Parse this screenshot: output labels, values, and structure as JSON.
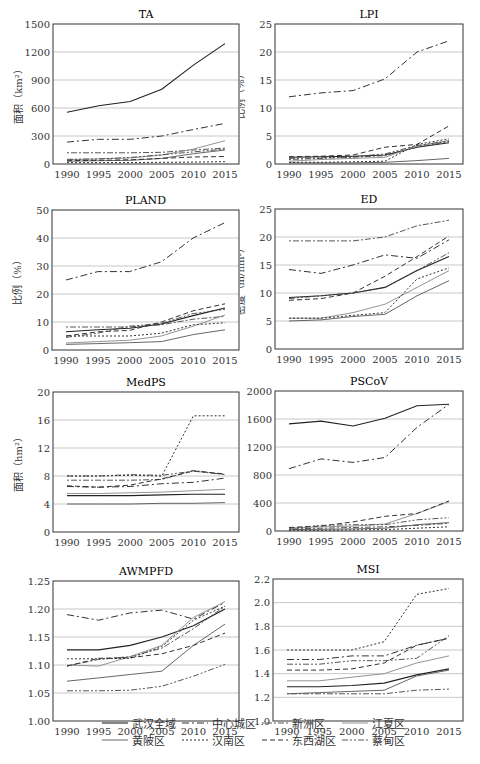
{
  "years": [
    1990,
    1995,
    2000,
    2005,
    2010,
    2015
  ],
  "series_names": [
    "武汉全域",
    "中心城区",
    "新洲区",
    "江夏区",
    "黄陂区",
    "汉南区",
    "东西湖区",
    "蔡甸区"
  ],
  "series_styles": [
    {
      "dash": "",
      "color": "#222",
      "width": 1.1
    },
    {
      "dash": "7,3,2,3",
      "color": "#333",
      "width": 1.0
    },
    {
      "dash": "2,2,6,2",
      "color": "#444",
      "width": 0.9
    },
    {
      "dash": "",
      "color": "#888",
      "width": 0.9
    },
    {
      "dash": "",
      "color": "#555",
      "width": 0.9
    },
    {
      "dash": "2,2",
      "color": "#333",
      "width": 1.0
    },
    {
      "dash": "5,3",
      "color": "#333",
      "width": 1.0
    },
    {
      "dash": "6,2,2,2,2,2",
      "color": "#444",
      "width": 0.9
    }
  ],
  "legend": {
    "rows": [
      [
        "武汉全域",
        "中心城区",
        "新洲区",
        "江夏区"
      ],
      [
        "黄陂区",
        "汉南区",
        "东西湖区",
        "蔡甸区"
      ]
    ]
  },
  "chart_data": [
    {
      "type": "line",
      "title": "TA",
      "ylabel": "面积（km²）",
      "ylim": [
        0,
        1500
      ],
      "yticks": [
        "0",
        "300",
        "600",
        "900",
        "1200",
        "1500"
      ],
      "xticks": [
        "1990",
        "1995",
        "2000",
        "2005",
        "2010",
        "2015"
      ],
      "series": [
        {
          "name": "武汉全域",
          "values": [
            555,
            625,
            670,
            800,
            1060,
            1290
          ]
        },
        {
          "name": "中心城区",
          "values": [
            235,
            265,
            265,
            300,
            370,
            435
          ]
        },
        {
          "name": "新洲区",
          "values": [
            120,
            120,
            120,
            125,
            150,
            170
          ]
        },
        {
          "name": "江夏区",
          "values": [
            45,
            55,
            65,
            95,
            160,
            250
          ]
        },
        {
          "name": "黄陂区",
          "values": [
            30,
            35,
            40,
            60,
            110,
            150
          ]
        },
        {
          "name": "汉南区",
          "values": [
            15,
            15,
            15,
            18,
            20,
            25
          ]
        },
        {
          "name": "东西湖区",
          "values": [
            35,
            40,
            45,
            60,
            75,
            80
          ]
        },
        {
          "name": "蔡甸区",
          "values": [
            50,
            55,
            70,
            100,
            130,
            160
          ]
        }
      ]
    },
    {
      "type": "line",
      "title": "LPI",
      "ylabel": "比例（%）",
      "ylim": [
        0,
        25
      ],
      "yticks": [
        "0",
        "5",
        "10",
        "15",
        "20",
        "25"
      ],
      "xticks": [
        "1990",
        "1995",
        "2000",
        "2005",
        "2010",
        "2015"
      ],
      "series": [
        {
          "name": "武汉全域",
          "values": [
            1.2,
            1.3,
            1.4,
            1.6,
            3.0,
            3.8
          ]
        },
        {
          "name": "中心城区",
          "values": [
            12.0,
            12.7,
            13.1,
            15.2,
            20.0,
            22.0
          ]
        },
        {
          "name": "新洲区",
          "values": [
            0.8,
            1.0,
            1.2,
            1.5,
            3.0,
            4.0
          ]
        },
        {
          "name": "江夏区",
          "values": [
            0.5,
            0.8,
            1.0,
            1.2,
            3.2,
            4.2
          ]
        },
        {
          "name": "黄陂区",
          "values": [
            0.2,
            0.2,
            0.2,
            0.3,
            0.6,
            1.0
          ]
        },
        {
          "name": "汉南区",
          "values": [
            0.3,
            0.3,
            0.4,
            0.5,
            3.5,
            4.5
          ]
        },
        {
          "name": "东西湖区",
          "values": [
            1.3,
            1.4,
            1.6,
            3.0,
            3.5,
            6.8
          ]
        },
        {
          "name": "蔡甸区",
          "values": [
            1.0,
            1.1,
            1.3,
            1.8,
            3.3,
            4.1
          ]
        }
      ]
    },
    {
      "type": "line",
      "title": "PLAND",
      "ylabel": "比例（%）",
      "ylim": [
        0,
        50
      ],
      "yticks": [
        "0",
        "10",
        "20",
        "30",
        "40",
        "50"
      ],
      "xticks": [
        "1990",
        "1995",
        "2000",
        "2005",
        "2010",
        "2015"
      ],
      "series": [
        {
          "name": "武汉全域",
          "values": [
            6.5,
            7.2,
            7.8,
            9.3,
            12.3,
            15.0
          ]
        },
        {
          "name": "中心城区",
          "values": [
            25.0,
            28.0,
            28.0,
            31.5,
            40.0,
            45.5
          ]
        },
        {
          "name": "新洲区",
          "values": [
            8.2,
            8.2,
            8.2,
            9.0,
            11.0,
            12.0
          ]
        },
        {
          "name": "江夏区",
          "values": [
            2.5,
            3.0,
            3.5,
            5.0,
            8.5,
            12.5
          ]
        },
        {
          "name": "黄陂区",
          "values": [
            2.0,
            2.3,
            2.6,
            3.0,
            5.5,
            7.2
          ]
        },
        {
          "name": "汉南区",
          "values": [
            5.0,
            5.0,
            5.0,
            6.0,
            9.0,
            9.7
          ]
        },
        {
          "name": "东西湖区",
          "values": [
            5.0,
            6.5,
            7.0,
            10.0,
            14.0,
            16.5
          ]
        },
        {
          "name": "蔡甸区",
          "values": [
            4.5,
            6.0,
            8.5,
            9.5,
            13.0,
            14.5
          ]
        }
      ]
    },
    {
      "type": "line",
      "title": "ED",
      "ylabel": "密度（m/hm²）",
      "ylim": [
        0,
        25
      ],
      "yticks": [
        "0",
        "5",
        "10",
        "15",
        "20",
        "25"
      ],
      "xticks": [
        "1990",
        "1995",
        "2000",
        "2005",
        "2010",
        "2015"
      ],
      "series": [
        {
          "name": "武汉全域",
          "values": [
            9.2,
            9.5,
            10.0,
            11.0,
            14.0,
            16.5
          ]
        },
        {
          "name": "中心城区",
          "values": [
            14.2,
            13.5,
            15.0,
            16.8,
            16.2,
            19.5
          ]
        },
        {
          "name": "新洲区",
          "values": [
            19.3,
            19.3,
            19.3,
            20.0,
            22.0,
            23.0
          ]
        },
        {
          "name": "江夏区",
          "values": [
            5.5,
            5.5,
            6.5,
            8.0,
            11.0,
            14.0
          ]
        },
        {
          "name": "黄陂区",
          "values": [
            5.0,
            5.2,
            5.8,
            6.2,
            9.5,
            12.2
          ]
        },
        {
          "name": "汉南区",
          "values": [
            5.5,
            5.5,
            6.0,
            6.5,
            12.5,
            14.5
          ]
        },
        {
          "name": "东西湖区",
          "values": [
            8.7,
            9.0,
            10.0,
            13.0,
            16.5,
            20.2
          ]
        },
        {
          "name": "蔡甸区",
          "values": [
            9.0,
            9.5,
            10.0,
            11.0,
            14.0,
            17.2
          ]
        }
      ]
    },
    {
      "type": "line",
      "title": "MedPS",
      "ylabel": "面积（hm²）",
      "ylim": [
        0,
        20
      ],
      "yticks": [
        "0",
        "4",
        "8",
        "12",
        "16",
        "20"
      ],
      "xticks": [
        "1990",
        "1995",
        "2000",
        "2005",
        "2010",
        "2015"
      ],
      "series": [
        {
          "name": "武汉全域",
          "values": [
            5.2,
            5.2,
            5.2,
            5.3,
            5.4,
            5.4
          ]
        },
        {
          "name": "中心城区",
          "values": [
            6.5,
            6.4,
            6.5,
            6.9,
            7.1,
            7.7
          ]
        },
        {
          "name": "新洲区",
          "values": [
            7.4,
            7.4,
            7.4,
            7.5,
            8.8,
            8.2
          ]
        },
        {
          "name": "江夏区",
          "values": [
            5.5,
            5.5,
            5.6,
            5.7,
            5.9,
            6.1
          ]
        },
        {
          "name": "黄陂区",
          "values": [
            4.0,
            4.0,
            4.0,
            4.1,
            4.1,
            4.2
          ]
        },
        {
          "name": "汉南区",
          "values": [
            8.0,
            8.0,
            8.1,
            8.0,
            16.6,
            16.6
          ]
        },
        {
          "name": "东西湖区",
          "values": [
            6.6,
            6.4,
            6.7,
            7.6,
            8.7,
            8.3
          ]
        },
        {
          "name": "蔡甸区",
          "values": [
            8.0,
            8.0,
            8.2,
            8.1,
            8.7,
            8.2
          ]
        }
      ]
    },
    {
      "type": "line",
      "title": "PSCoV",
      "ylabel": "",
      "ylim": [
        0,
        2000
      ],
      "yticks": [
        "0",
        "400",
        "800",
        "1200",
        "1600",
        "2000"
      ],
      "xticks": [
        "1990",
        "1995",
        "2000",
        "2005",
        "2010",
        "2015"
      ],
      "series": [
        {
          "name": "武汉全域",
          "values": [
            1530,
            1570,
            1500,
            1610,
            1790,
            1810
          ]
        },
        {
          "name": "中心城区",
          "values": [
            890,
            1030,
            980,
            1050,
            1480,
            1810
          ]
        },
        {
          "name": "新洲区",
          "values": [
            30,
            40,
            50,
            60,
            80,
            110
          ]
        },
        {
          "name": "江夏区",
          "values": [
            40,
            60,
            70,
            100,
            250,
            420
          ]
        },
        {
          "name": "黄陂区",
          "values": [
            20,
            25,
            30,
            40,
            90,
            120
          ]
        },
        {
          "name": "汉南区",
          "values": [
            10,
            10,
            15,
            20,
            40,
            60
          ]
        },
        {
          "name": "东西湖区",
          "values": [
            50,
            70,
            130,
            210,
            250,
            430
          ]
        },
        {
          "name": "蔡甸区",
          "values": [
            40,
            80,
            90,
            90,
            160,
            190
          ]
        }
      ]
    },
    {
      "type": "line",
      "title": "AWMPFD",
      "ylabel": "",
      "ylim": [
        1.0,
        1.25
      ],
      "yticks": [
        "1.00",
        "1.05",
        "1.10",
        "1.15",
        "1.20",
        "1.25"
      ],
      "xticks": [
        "1990",
        "1995",
        "2000",
        "2005",
        "2010",
        "2015"
      ],
      "series": [
        {
          "name": "武汉全域",
          "values": [
            1.127,
            1.127,
            1.135,
            1.15,
            1.17,
            1.2
          ]
        },
        {
          "name": "中心城区",
          "values": [
            1.19,
            1.18,
            1.193,
            1.198,
            1.182,
            1.212
          ]
        },
        {
          "name": "新洲区",
          "values": [
            1.098,
            1.11,
            1.115,
            1.13,
            1.165,
            1.205
          ]
        },
        {
          "name": "江夏区",
          "values": [
            1.1,
            1.098,
            1.115,
            1.135,
            1.185,
            1.213
          ]
        },
        {
          "name": "黄陂区",
          "values": [
            1.071,
            1.077,
            1.083,
            1.089,
            1.135,
            1.173
          ]
        },
        {
          "name": "汉南区",
          "values": [
            1.111,
            1.111,
            1.112,
            1.133,
            1.18,
            1.205
          ]
        },
        {
          "name": "东西湖区",
          "values": [
            1.098,
            1.112,
            1.113,
            1.12,
            1.135,
            1.157
          ]
        },
        {
          "name": "蔡甸区",
          "values": [
            1.054,
            1.054,
            1.055,
            1.062,
            1.08,
            1.101
          ]
        }
      ]
    },
    {
      "type": "line",
      "title": "MSI",
      "ylabel": "",
      "ylim": [
        1.0,
        2.2
      ],
      "yticks": [
        "1.0",
        "1.2",
        "1.4",
        "1.6",
        "1.8",
        "2.0",
        "2.2"
      ],
      "xticks": [
        "1990",
        "1995",
        "2000",
        "2005",
        "2010",
        "2015"
      ],
      "series": [
        {
          "name": "武汉全域",
          "values": [
            1.29,
            1.29,
            1.3,
            1.32,
            1.39,
            1.44
          ]
        },
        {
          "name": "中心城区",
          "values": [
            1.52,
            1.52,
            1.55,
            1.55,
            1.64,
            1.7
          ]
        },
        {
          "name": "新洲区",
          "values": [
            1.23,
            1.23,
            1.23,
            1.23,
            1.26,
            1.27
          ]
        },
        {
          "name": "江夏区",
          "values": [
            1.34,
            1.34,
            1.37,
            1.4,
            1.49,
            1.55
          ]
        },
        {
          "name": "黄陂区",
          "values": [
            1.23,
            1.24,
            1.25,
            1.26,
            1.38,
            1.43
          ]
        },
        {
          "name": "汉南区",
          "values": [
            1.6,
            1.6,
            1.6,
            1.67,
            2.07,
            2.12
          ]
        },
        {
          "name": "东西湖区",
          "values": [
            1.43,
            1.43,
            1.44,
            1.49,
            1.64,
            1.7
          ]
        },
        {
          "name": "蔡甸区",
          "values": [
            1.48,
            1.48,
            1.51,
            1.51,
            1.53,
            1.72
          ]
        }
      ]
    }
  ]
}
